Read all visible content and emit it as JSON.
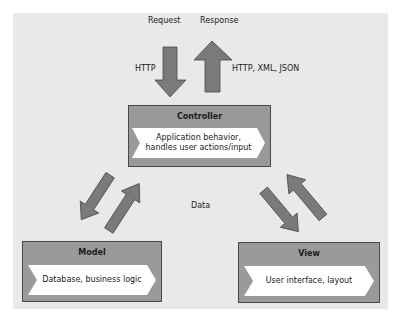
{
  "diagram": {
    "top_labels": {
      "request": "Request",
      "response": "Response",
      "request_protocol": "HTTP",
      "response_protocol": "HTTP, XML, JSON"
    },
    "center_label": "Data",
    "controller": {
      "title": "Controller",
      "description_line1": "Application behavior,",
      "description_line2": "handles user actions/input"
    },
    "model": {
      "title": "Model",
      "description": "Database, business logic"
    },
    "view": {
      "title": "View",
      "description": "User interface, layout"
    },
    "colors": {
      "panel_background": "#e9e9e9",
      "box_fill": "#9a9a9a",
      "box_border": "#4a4a4a",
      "arrow_fill": "#7a7a7a",
      "arrow_stroke": "#4a4a4a",
      "chevron_fill": "#ffffff"
    }
  }
}
